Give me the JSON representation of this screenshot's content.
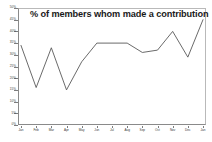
{
  "chart_data": {
    "type": "line",
    "title": "% of members whom made a contribution",
    "xlabel": "",
    "ylabel": "",
    "categories": [
      "Jan",
      "Feb",
      "Mar",
      "Apr",
      "May",
      "Jun",
      "Jul",
      "Aug",
      "Sep",
      "Oct",
      "Nov",
      "Dec",
      "Jan"
    ],
    "values": [
      34,
      16,
      33,
      15,
      27,
      35,
      35,
      35,
      31,
      32,
      40,
      29,
      45
    ],
    "ylim": [
      0,
      50
    ],
    "ytick_labels": [
      "0%",
      "5%",
      "10%",
      "15%",
      "20%",
      "25%",
      "30%",
      "35%",
      "40%",
      "45%",
      "50%"
    ],
    "ytick_values": [
      0,
      5,
      10,
      15,
      20,
      25,
      30,
      35,
      40,
      45,
      50
    ],
    "grid": false,
    "legend": false,
    "series_color": "#595959",
    "axis_color": "#8a8a8a",
    "background": "#ffffff"
  }
}
